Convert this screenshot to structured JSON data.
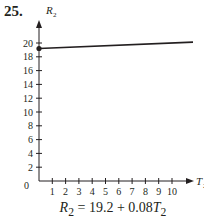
{
  "problem_number": "25.",
  "equation": {
    "lhs": "R",
    "lhs_sub": "2",
    "rhs": "= 19.2 + 0.08",
    "rhs_var": "T",
    "rhs_sub": "2"
  },
  "chart_data": {
    "type": "line",
    "title": "",
    "xlabel": "T2",
    "ylabel": "R2",
    "x_ticks": [
      1,
      2,
      3,
      4,
      5,
      6,
      7,
      8,
      9,
      10
    ],
    "y_ticks": [
      2,
      4,
      6,
      8,
      10,
      12,
      14,
      16,
      18,
      20
    ],
    "origin_label": "0",
    "xlim": [
      0,
      11.5
    ],
    "ylim": [
      0,
      21
    ],
    "grid": false,
    "series": [
      {
        "name": "R2 = 19.2 + 0.08T2",
        "x": [
          0,
          11.5
        ],
        "y": [
          19.2,
          20.12
        ],
        "start_marker": "filled-dot"
      }
    ]
  }
}
